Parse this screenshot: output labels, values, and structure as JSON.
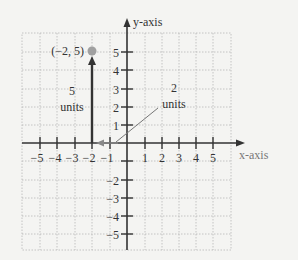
{
  "diagram": {
    "y_axis_label": "y-axis",
    "x_axis_label": "x-axis",
    "x_ticks": [
      "−5",
      "−4",
      "−3",
      "−2",
      "−1",
      "1",
      "2",
      "3",
      "4",
      "5"
    ],
    "y_ticks": [
      "5",
      "4",
      "3",
      "2",
      "1",
      "−2",
      "−3",
      "−4",
      "−5"
    ],
    "point": {
      "label": "(−2, 5)",
      "x": -2,
      "y": 5,
      "color": "#a0a0a0"
    },
    "vertical_annotation": {
      "value": "5",
      "unit": "units"
    },
    "horizontal_annotation": {
      "value": "2",
      "unit": "units"
    },
    "colors": {
      "axis": "#333333",
      "grid": "#b8b8b8",
      "leader": "#777777"
    }
  }
}
